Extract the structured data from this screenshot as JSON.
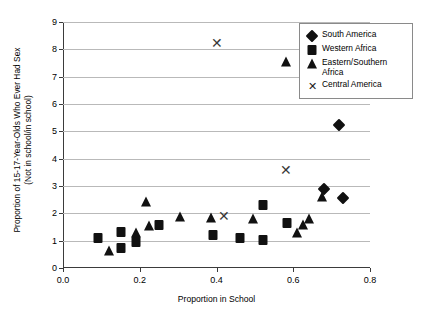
{
  "chart_data": {
    "type": "scatter",
    "title": "",
    "xlabel": "Proportion in School",
    "ylabel_line1": "Proportion of 15-17-Year-Olds Who Ever Had Sex",
    "ylabel_line2": "(Not in school/in school)",
    "xlim": [
      0.0,
      0.8
    ],
    "ylim": [
      0,
      9
    ],
    "xticks": [
      "0.0",
      "0.2",
      "0.4",
      "0.6",
      "0.8"
    ],
    "xtick_values": [
      0.0,
      0.2,
      0.4,
      0.6,
      0.8
    ],
    "yticks": [
      "0",
      "1",
      "2",
      "3",
      "4",
      "5",
      "6",
      "7",
      "8",
      "9"
    ],
    "ytick_values": [
      0,
      1,
      2,
      3,
      4,
      5,
      6,
      7,
      8,
      9
    ],
    "grid": "horizontal",
    "legend_position": "top-right",
    "marker_color": "#111111",
    "gridline_color": "#b9b9b9",
    "axis_color": "#3b3b3b",
    "series": [
      {
        "name": "South America",
        "marker": "diamond",
        "points": [
          [
            0.72,
            5.22
          ],
          [
            0.68,
            2.9
          ],
          [
            0.73,
            2.55
          ]
        ]
      },
      {
        "name": "Western Africa",
        "marker": "square",
        "points": [
          [
            0.09,
            1.08
          ],
          [
            0.15,
            0.72
          ],
          [
            0.15,
            1.33
          ],
          [
            0.19,
            0.95
          ],
          [
            0.25,
            1.58
          ],
          [
            0.39,
            1.22
          ],
          [
            0.46,
            1.1
          ],
          [
            0.52,
            1.03
          ],
          [
            0.52,
            2.3
          ],
          [
            0.585,
            1.63
          ]
        ]
      },
      {
        "name": "Eastern/Southern Africa",
        "marker": "triangle",
        "points": [
          [
            0.58,
            7.55
          ],
          [
            0.12,
            0.62
          ],
          [
            0.19,
            1.28
          ],
          [
            0.215,
            2.4
          ],
          [
            0.225,
            1.52
          ],
          [
            0.305,
            1.85
          ],
          [
            0.385,
            1.82
          ],
          [
            0.495,
            1.78
          ],
          [
            0.61,
            1.28
          ],
          [
            0.625,
            1.58
          ],
          [
            0.64,
            1.78
          ],
          [
            0.675,
            2.6
          ]
        ]
      },
      {
        "name": "Central America",
        "marker": "x",
        "points": [
          [
            0.4,
            8.25
          ],
          [
            0.58,
            3.6
          ],
          [
            0.42,
            1.9
          ]
        ]
      }
    ]
  },
  "legend": {
    "entries": [
      {
        "label": "South America",
        "marker": "diamond"
      },
      {
        "label": "Western Africa",
        "marker": "square"
      },
      {
        "label": "Eastern/Southern Africa",
        "marker": "triangle"
      },
      {
        "label": "Central America",
        "marker": "x"
      }
    ]
  }
}
